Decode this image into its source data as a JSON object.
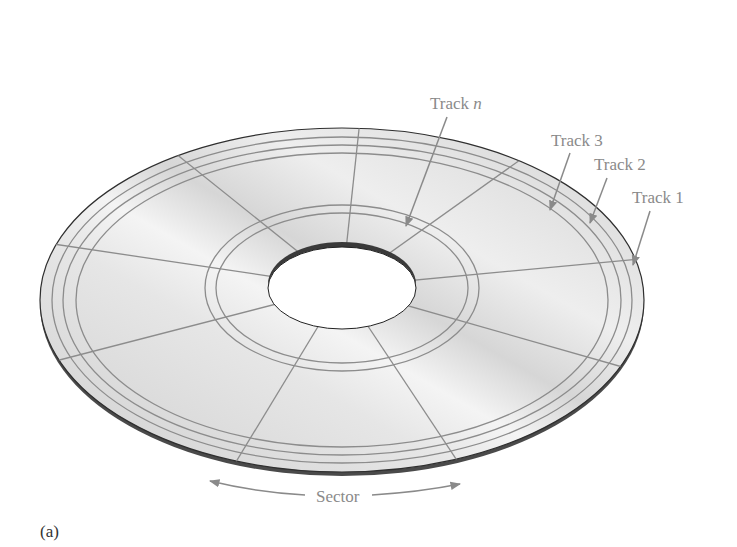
{
  "diagram": {
    "type": "disk-surface-tracks-sectors",
    "panel_label": "(a)",
    "labels": {
      "track_n_prefix": "Track ",
      "track_n_var": "n",
      "track_3": "Track 3",
      "track_2": "Track 2",
      "track_1": "Track 1",
      "sector": "Sector"
    },
    "colors": {
      "disk_surface": "#d8d8d8",
      "disk_edge": "#3a3a3a",
      "track_line": "#8c8c8c",
      "label_text": "#8a8a8a",
      "background": "#ffffff"
    },
    "tracks_shown": [
      "Track 1",
      "Track 2",
      "Track 3",
      "Track n"
    ],
    "sector_count": 12
  }
}
